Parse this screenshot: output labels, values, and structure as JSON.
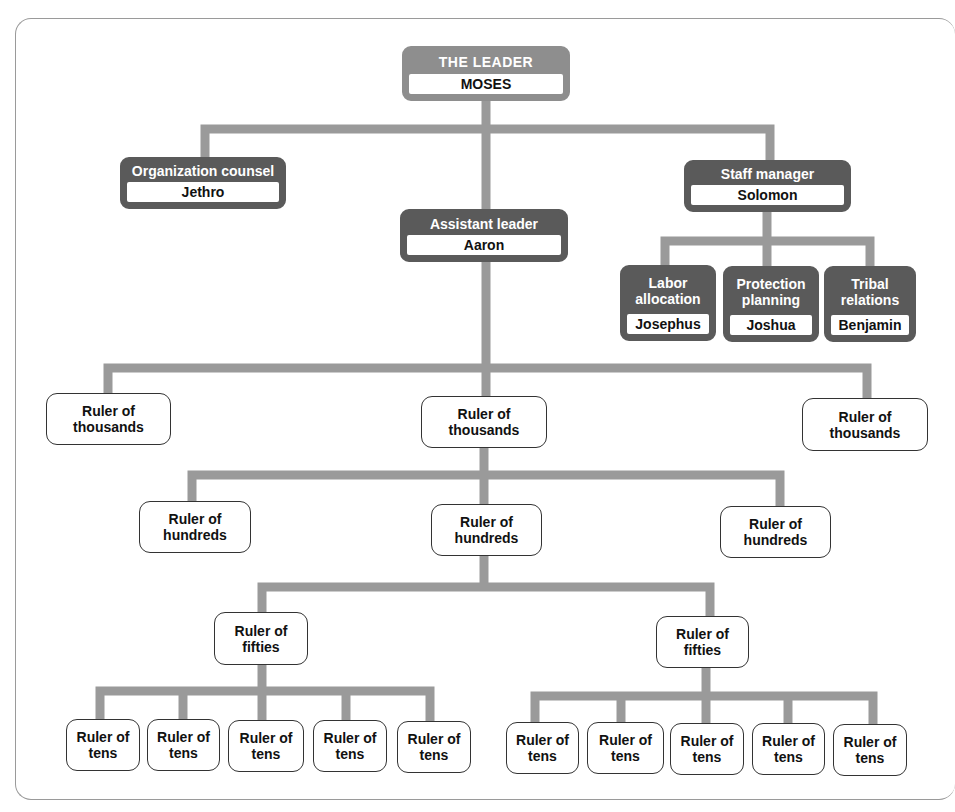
{
  "colors": {
    "connector": "#9a9a9a",
    "header_dark": "#5a5a5a",
    "header_leader": "#8e8e8e",
    "box_border": "#333333",
    "background": "#ffffff"
  },
  "leader": {
    "title": "THE LEADER",
    "name": "MOSES"
  },
  "advisors": {
    "organization_counsel": {
      "title": "Organization counsel",
      "name": "Jethro"
    },
    "assistant_leader": {
      "title": "Assistant leader",
      "name": "Aaron"
    },
    "staff_manager": {
      "title": "Staff manager",
      "name": "Solomon"
    }
  },
  "staff": [
    {
      "title": "Labor allocation",
      "name": "Josephus"
    },
    {
      "title": "Protection planning",
      "name": "Joshua"
    },
    {
      "title": "Tribal relations",
      "name": "Benjamin"
    }
  ],
  "thousands": [
    "Ruler of\nthousands",
    "Ruler of\nthousands",
    "Ruler of\nthousands"
  ],
  "hundreds": [
    "Ruler of\nhundreds",
    "Ruler of\nhundreds",
    "Ruler of\nhundreds"
  ],
  "fifties": [
    "Ruler of\nfifties",
    "Ruler of\nfifties"
  ],
  "tens_left": [
    "Ruler of\ntens",
    "Ruler of\ntens",
    "Ruler of\ntens",
    "Ruler of\ntens",
    "Ruler of\ntens"
  ],
  "tens_right": [
    "Ruler of\ntens",
    "Ruler of\ntens",
    "Ruler of\ntens",
    "Ruler of\ntens",
    "Ruler of\ntens"
  ]
}
